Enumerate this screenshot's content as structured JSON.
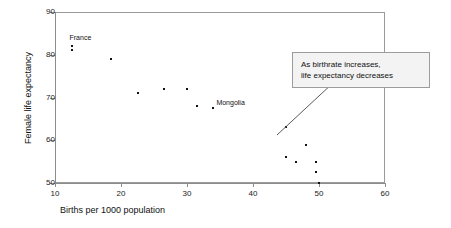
{
  "chart_data": {
    "type": "scatter",
    "title": "",
    "xlabel": "Births per 1000 population",
    "ylabel": "Female life expectancy",
    "xlim": [
      10,
      60
    ],
    "ylim": [
      50,
      90
    ],
    "xticks": [
      10,
      20,
      30,
      40,
      50,
      60
    ],
    "yticks": [
      50,
      60,
      70,
      80,
      90
    ],
    "grid": false,
    "legend": null,
    "points": [
      {
        "x": 12.5,
        "y": 82.0,
        "label": "France"
      },
      {
        "x": 12.5,
        "y": 81.0,
        "label": null
      },
      {
        "x": 18.5,
        "y": 79.0,
        "label": null
      },
      {
        "x": 22.5,
        "y": 71.0,
        "label": null
      },
      {
        "x": 26.5,
        "y": 72.0,
        "label": null
      },
      {
        "x": 30.0,
        "y": 72.0,
        "label": null
      },
      {
        "x": 31.5,
        "y": 68.0,
        "label": null
      },
      {
        "x": 34.0,
        "y": 67.5,
        "label": "Mongolia"
      },
      {
        "x": 45.0,
        "y": 63.0,
        "label": null
      },
      {
        "x": 45.0,
        "y": 56.0,
        "label": null
      },
      {
        "x": 46.5,
        "y": 55.0,
        "label": null
      },
      {
        "x": 48.0,
        "y": 59.0,
        "label": null
      },
      {
        "x": 49.5,
        "y": 55.0,
        "label": null
      },
      {
        "x": 49.5,
        "y": 52.5,
        "label": null
      },
      {
        "x": 50.0,
        "y": 50.0,
        "label": null
      }
    ],
    "annotations": [
      {
        "name": "trend-callout",
        "lines": [
          "As birthrate increases,",
          "life expectancy decreases"
        ],
        "points_to": {
          "x": 43.5,
          "y": 62.0
        }
      }
    ]
  },
  "axes": {
    "y_labels": [
      "90",
      "80",
      "70",
      "60",
      "50"
    ],
    "x_labels": [
      "10",
      "20",
      "30",
      "40",
      "50",
      "60"
    ],
    "y_title": "Female life expectancy",
    "x_title": "Births per 1000 population"
  },
  "point_labels": {
    "france": "France",
    "mongolia": "Mongolia"
  },
  "annotation": {
    "line1": "As birthrate increases,",
    "line2": "life expectancy decreases"
  },
  "colors": {
    "marker": "#111111",
    "axis": "#8d8d8d",
    "frame": "#9a9a9a",
    "annotation_bg": "#f3f3f3",
    "annotation_border": "#9c9c9c",
    "text": "#111111"
  }
}
